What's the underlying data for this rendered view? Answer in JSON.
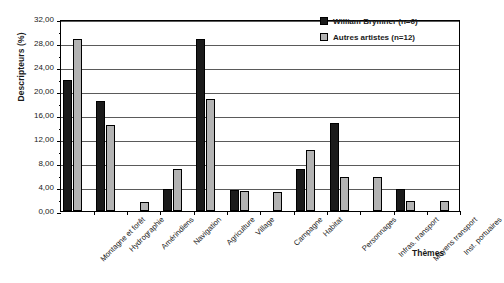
{
  "chart_data": {
    "type": "bar",
    "title": "",
    "xlabel": "Thèmes",
    "ylabel": "Descripteurs (%)",
    "ylim": [
      0,
      32
    ],
    "ytick_step": 4,
    "ytick_labels": [
      "0,00",
      "4,00",
      "8,00",
      "12,00",
      "16,00",
      "20,00",
      "24,00",
      "28,00",
      "32,00"
    ],
    "grid": true,
    "legend_position": "top-right",
    "categories": [
      "Montagne et forêt",
      "Hydrographie",
      "Amérindiens",
      "Navigation",
      "Agriculture",
      "Village",
      "Campagne",
      "Habitat",
      "Personnages",
      "Infras. transport",
      "Moyens transport",
      "Inst. portuaires"
    ],
    "series": [
      {
        "name": "William Brymner (n=6)",
        "color": "#1b1b1b",
        "values": [
          21.8,
          18.3,
          0.0,
          3.7,
          28.7,
          3.5,
          0.0,
          7.0,
          14.7,
          0.0,
          3.6,
          0.0
        ]
      },
      {
        "name": "Autres artistes (n=12)",
        "color": "#b3b3b3",
        "values": [
          28.7,
          14.4,
          1.5,
          7.0,
          18.7,
          3.3,
          3.2,
          10.2,
          5.7,
          5.6,
          1.6,
          1.6
        ]
      }
    ]
  }
}
